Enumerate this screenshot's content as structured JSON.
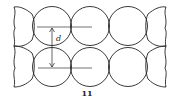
{
  "figure": {
    "caption": "11",
    "dimension_label": "d",
    "rows": 2,
    "full_circles_per_row": 3,
    "partial_arcs": [
      "left",
      "right"
    ],
    "stroke_color": "#222222"
  }
}
